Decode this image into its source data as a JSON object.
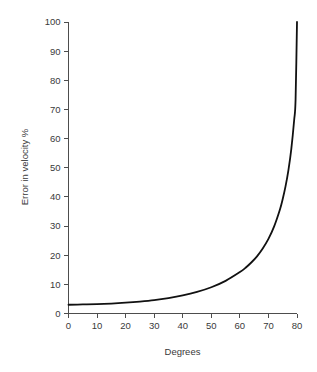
{
  "chart_data": {
    "type": "line",
    "title": "",
    "subtitle": "",
    "xlabel": "Degrees",
    "ylabel": "Error in velocity %",
    "xlim": [
      0,
      80
    ],
    "ylim": [
      0,
      100
    ],
    "grid": false,
    "legend": null,
    "legend_position": "none",
    "xticks": [
      0,
      10,
      20,
      30,
      40,
      50,
      60,
      70,
      80
    ],
    "xtick_labels": [
      "0",
      "10",
      "20",
      "30",
      "40",
      "50",
      "60",
      "70",
      "80"
    ],
    "yticks": [
      0,
      10,
      20,
      30,
      40,
      50,
      60,
      70,
      80,
      90,
      100
    ],
    "ytick_labels": [
      "0",
      "10",
      "20",
      "30",
      "40",
      "50",
      "60",
      "70",
      "80",
      "90",
      "100"
    ],
    "series": [
      {
        "name": "Error in velocity",
        "color": "#111111",
        "x": [
          0,
          5,
          10,
          15,
          20,
          25,
          30,
          35,
          40,
          45,
          50,
          55,
          60,
          62,
          64,
          66,
          68,
          70,
          72,
          74,
          75,
          76,
          77,
          78,
          79,
          79.5,
          80
        ],
        "values": [
          3.0,
          3.1,
          3.2,
          3.4,
          3.7,
          4.1,
          4.6,
          5.3,
          6.2,
          7.4,
          9.0,
          11.2,
          14.2,
          15.7,
          17.5,
          19.6,
          22.3,
          25.6,
          29.9,
          35.6,
          39.3,
          43.7,
          49.2,
          56.4,
          66.3,
          73.3,
          100.0
        ]
      }
    ],
    "curve_notes": {
      "start_value": 3,
      "end_value": 100,
      "shape": "secant-like exponential rise"
    }
  },
  "axis": {
    "x_title": "Degrees",
    "y_title": "Error in velocity %"
  },
  "colors": {
    "curve": "#111111",
    "axis": "#4d4d4d",
    "text": "#3a3a3a",
    "background": "#ffffff"
  }
}
